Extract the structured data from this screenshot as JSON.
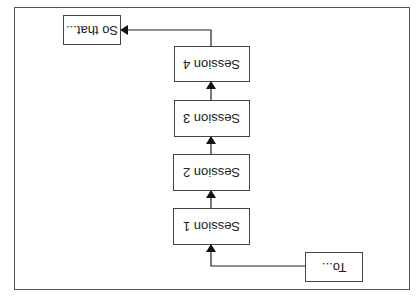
{
  "diagram": {
    "orientation": "rotated 180 degrees",
    "start": {
      "label": "To..."
    },
    "sessions": [
      {
        "label": "Session 1"
      },
      {
        "label": "Session 2"
      },
      {
        "label": "Session 3"
      },
      {
        "label": "Session 4"
      }
    ],
    "end": {
      "label": "So that..."
    },
    "colors": {
      "line": "#222222",
      "border": "#444444",
      "frame": "#555555"
    }
  }
}
